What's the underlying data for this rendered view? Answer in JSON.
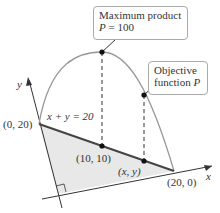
{
  "callouts": {
    "maximum": {
      "line1": "Maximum product",
      "line2_var": "P",
      "line2_rest": " = 100"
    },
    "objective": {
      "line1": "Objective",
      "line2_text": "function ",
      "line2_var": "P"
    }
  },
  "axes": {
    "x_label": "x",
    "y_label": "y"
  },
  "labels": {
    "equation": "x + y = 20",
    "point_0_20": "(0, 20)",
    "point_10_10": "(10, 10)",
    "point_xy": "(x, y)",
    "point_20_0": "(20, 0)"
  },
  "colors": {
    "curve": "#9a9a9a",
    "line": "#4a4a4a",
    "region": "#e6e6e6",
    "dot": "#111111"
  }
}
